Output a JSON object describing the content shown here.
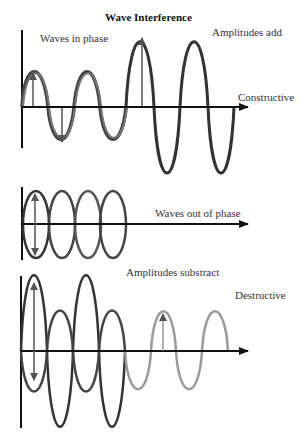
{
  "title": "Wave Interference",
  "panels": {
    "constructive": {
      "label_left": "Waves in phase",
      "label_top": "Amplitudes add",
      "label_axis": "Constructive"
    },
    "out_of_phase": {
      "label_axis": "Waves out of phase"
    },
    "destructive": {
      "label_top": "Amplitudes substract",
      "label_right": "Destructive"
    }
  },
  "colors": {
    "wave_dark": "#2b2b2b",
    "wave_mid": "#555555",
    "wave_light": "#9a9a9a",
    "arrow": "#555555",
    "axis": "#111111"
  }
}
